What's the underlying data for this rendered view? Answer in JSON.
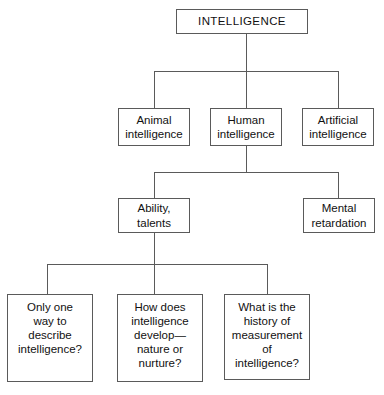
{
  "diagram": {
    "type": "hierarchy-tree",
    "colors": {
      "background": "#ffffff",
      "border": "#5a5a5a",
      "text": "#111111",
      "connector": "#5a5a5a"
    },
    "nodes": {
      "root": "INTELLIGENCE",
      "level2": [
        "Animal\nintelligence",
        "Human\nintelligence",
        "Artificial\nintelligence"
      ],
      "level3": [
        "Ability,\ntalents",
        "Mental\nretardation"
      ],
      "level4": [
        "Only one\nway to\ndescribe\nintelligence?",
        "How does\nintelligence\ndevelop—\nnature or\nnurture?",
        "What is the\nhistory of\nmeasurement\nof\nintelligence?"
      ]
    }
  }
}
